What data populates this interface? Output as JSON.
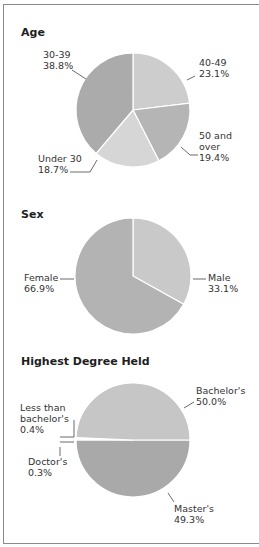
{
  "chart_data": [
    {
      "type": "pie",
      "title": "Age",
      "categories": [
        "40-49",
        "50 and over",
        "Under 30",
        "30-39"
      ],
      "values": [
        23.1,
        19.4,
        18.7,
        38.8
      ],
      "labels": [
        "40-49\n23.1%",
        "50 and\nover\n19.4%",
        "Under 30\n18.7%",
        "30-39\n38.8%"
      ],
      "colors": [
        "#cdcdcd",
        "#b5b5b5",
        "#d6d6d6",
        "#ababab"
      ]
    },
    {
      "type": "pie",
      "title": "Sex",
      "categories": [
        "Male",
        "Female"
      ],
      "values": [
        33.1,
        66.9
      ],
      "labels": [
        "Male\n33.1%",
        "Female\n66.9%"
      ],
      "colors": [
        "#c9c9c9",
        "#b3b3b3"
      ]
    },
    {
      "type": "pie",
      "title": "Highest Degree Held",
      "categories": [
        "Bachelor's",
        "Less than bachelor's",
        "Doctor's",
        "Master's"
      ],
      "values": [
        50.0,
        0.4,
        0.3,
        49.3
      ],
      "labels": [
        "Bachelor's\n50.0%",
        "Less than\nbachelor's\n0.4%",
        "Doctor's\n0.3%",
        "Master's\n49.3%"
      ],
      "colors": [
        "#a9a9a9",
        "#8a8a8a",
        "#9a9a9a",
        "#c6c6c6"
      ]
    }
  ],
  "sections": {
    "age": {
      "title": "Age",
      "labels": {
        "a4049": "40-49\n23.1%",
        "a50": "50 and\nover\n19.4%",
        "u30": "Under 30\n18.7%",
        "a3039": "30-39\n38.8%"
      }
    },
    "sex": {
      "title": "Sex",
      "labels": {
        "female": "Female\n66.9%",
        "male": "Male\n33.1%"
      }
    },
    "degree": {
      "title": "Highest Degree Held",
      "labels": {
        "bachelor": "Bachelor's\n50.0%",
        "less": "Less than\nbachelor's\n0.4%",
        "doctor": "Doctor's\n0.3%",
        "master": "Master's\n49.3%"
      }
    }
  }
}
